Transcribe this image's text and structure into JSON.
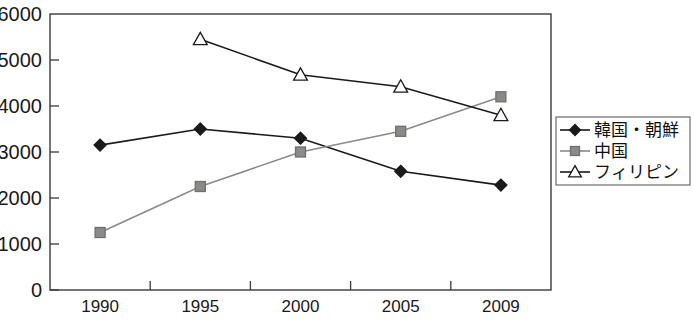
{
  "chart_data": {
    "type": "line",
    "title": "",
    "subtitle": "",
    "xlabel": "",
    "ylabel": "",
    "categories": [
      "1990",
      "1995",
      "2000",
      "2005",
      "2009"
    ],
    "x": [
      1990,
      1995,
      2000,
      2005,
      2009
    ],
    "ylim": [
      0,
      6000
    ],
    "xlim_categorical": true,
    "yticks": [
      0,
      1000,
      2000,
      3000,
      4000,
      5000,
      6000
    ],
    "ytick_labels": [
      "0",
      "1000",
      "2000",
      "3000",
      "4000",
      "5000",
      "6000"
    ],
    "xtick_labels": [
      "1990",
      "1995",
      "2000",
      "2005",
      "2009"
    ],
    "grid": false,
    "legend_position": "right-outside",
    "series": [
      {
        "name": "韓国・朝鮮",
        "marker": "diamond",
        "color": "#1a1a1a",
        "line_color": "#1a1a1a",
        "values": [
          3150,
          3500,
          3300,
          2580,
          2280
        ]
      },
      {
        "name": "中国",
        "marker": "square",
        "color": "#8a8a88",
        "line_color": "#8a8a88",
        "values": [
          1250,
          2250,
          3000,
          3450,
          4200
        ]
      },
      {
        "name": "フィリピン",
        "marker": "triangle-open",
        "color": "#ffffff",
        "line_color": "#1a1a1a",
        "values": [
          null,
          5450,
          4680,
          4420,
          3800
        ]
      }
    ],
    "annotations": []
  },
  "legend": {
    "items": [
      {
        "label": "韓国・朝鮮",
        "marker": "diamond"
      },
      {
        "label": "中国",
        "marker": "square"
      },
      {
        "label": "フィリピン",
        "marker": "triangle-open"
      }
    ]
  },
  "colors": {
    "axis": "#3a3a38",
    "text": "#1a1a1a",
    "series_korea": "#1a1a1a",
    "series_china": "#8a8a88",
    "series_philippines": "#1a1a1a",
    "background": "#ffffff",
    "legend_border": "#6b6b68"
  }
}
